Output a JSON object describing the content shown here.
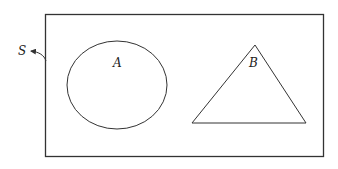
{
  "diagram": {
    "type": "venn-diagram",
    "universal_set": {
      "label": "S",
      "shape": "rectangle"
    },
    "sets": [
      {
        "label": "A",
        "shape": "circle"
      },
      {
        "label": "B",
        "shape": "triangle"
      }
    ],
    "relationship": "disjoint"
  },
  "colors": {
    "stroke": "#333333",
    "background": "#ffffff"
  }
}
